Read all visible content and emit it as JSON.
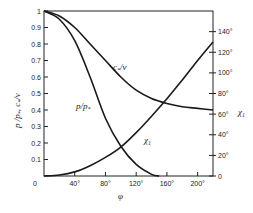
{
  "chart_data": {
    "type": "line",
    "title": "",
    "xlabel": "φ",
    "ylabel": "p/p*, c*/v",
    "y2label": "χ₁",
    "xlim": [
      0,
      220
    ],
    "ylim": [
      0,
      1
    ],
    "y2lim": [
      0,
      160
    ],
    "grid": false,
    "x_ticks": [
      "0",
      "40°",
      "80°",
      "120°",
      "160°",
      "200°"
    ],
    "y_ticks": [
      "0.1",
      "0.2",
      "0.3",
      "0.4",
      "0.5",
      "0.6",
      "0.7",
      "0.8",
      "0.9",
      "1"
    ],
    "y2_ticks": [
      "0",
      "20°",
      "40°",
      "60°",
      "80°",
      "100°",
      "120°",
      "140°"
    ],
    "series": [
      {
        "name": "p/p*",
        "axis": "left",
        "x": [
          0,
          20,
          40,
          60,
          80,
          100,
          120,
          140,
          150
        ],
        "y": [
          1.0,
          0.95,
          0.82,
          0.6,
          0.35,
          0.18,
          0.07,
          0.01,
          0.0
        ]
      },
      {
        "name": "c*/v",
        "axis": "left",
        "x": [
          0,
          20,
          40,
          60,
          80,
          100,
          120,
          140,
          160,
          180,
          200,
          220
        ],
        "y": [
          1.0,
          0.97,
          0.9,
          0.8,
          0.7,
          0.6,
          0.52,
          0.47,
          0.44,
          0.42,
          0.41,
          0.4
        ]
      },
      {
        "name": "χ₁",
        "axis": "right",
        "x": [
          0,
          20,
          40,
          60,
          80,
          100,
          120,
          140,
          160,
          180,
          200,
          220
        ],
        "y": [
          0,
          1,
          4,
          10,
          18,
          28,
          42,
          58,
          75,
          93,
          112,
          130
        ]
      }
    ],
    "annotations": [
      {
        "text": "c*/v",
        "near": "c*/v curve"
      },
      {
        "text": "p/p*",
        "near": "p/p* curve"
      },
      {
        "text": "χ₁",
        "near": "χ₁ curve"
      },
      {
        "text": "χ₁",
        "near": "right axis label"
      }
    ]
  },
  "labels": {
    "ylabel": "p /p",
    "ylabel_sub": "*",
    "ylabel2": ", c",
    "ylabel2_sub": "*",
    "ylabel3": "/v",
    "xlabel": "φ",
    "y2label": "χ",
    "y2label_sub": "1",
    "curve_cv": "c",
    "curve_cv_sub": "*",
    "curve_cv_tail": "/v",
    "curve_pp": "p/p",
    "curve_pp_sub": "*",
    "curve_chi": "χ",
    "curve_chi_sub": "1",
    "origin": "0"
  }
}
